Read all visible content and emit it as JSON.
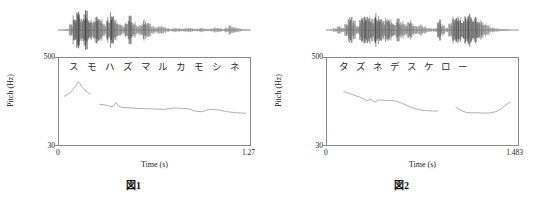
{
  "figures": [
    {
      "caption_label": "図",
      "caption_number": "1",
      "kana": [
        "ス",
        "モ",
        "ハ",
        "ズ",
        "マ",
        "ル",
        "カ",
        "モ",
        "シ",
        "ネ"
      ],
      "axes": {
        "ylabel": "Pitch (Hz)",
        "ytick_top": "500",
        "ytick_bottom": "30",
        "xlabel": "Time (s)",
        "xtick_left": "0",
        "xtick_right": "1.27"
      },
      "chart_data": {
        "type": "line",
        "title": "図 1",
        "xlabel": "Time (s)",
        "ylabel": "Pitch (Hz)",
        "xlim": [
          0,
          1.27
        ],
        "ylim": [
          30,
          500
        ],
        "yscale": "log",
        "grid": false,
        "legend": "none",
        "annotations": [
          "ス",
          "モ",
          "ハ",
          "ズ",
          "マ",
          "ル",
          "カ",
          "モ",
          "シ",
          "ネ"
        ],
        "series": [
          {
            "name": "f0-contour",
            "x": [
              0.035,
              0.055,
              0.075,
              0.09,
              0.105,
              0.118,
              0.13,
              0.14,
              0.15,
              0.165,
              0.18,
              0.195,
              0.21
            ],
            "y": [
              145,
              152,
              163,
              178,
              196,
              215,
              232,
              218,
              200,
              183,
              172,
              163,
              156
            ]
          },
          {
            "name": "f0-contour-2",
            "x": [
              0.27,
              0.3,
              0.33,
              0.36,
              0.38,
              0.4,
              0.43,
              0.47,
              0.52,
              0.58,
              0.64,
              0.7,
              0.76,
              0.82,
              0.86,
              0.9,
              0.95,
              1.0,
              1.06,
              1.12,
              1.18,
              1.24
            ],
            "y": [
              112,
              110,
              106,
              104,
              118,
              104,
              101,
              100,
              98,
              97,
              96,
              95,
              99,
              98,
              97,
              90,
              88,
              95,
              93,
              88,
              85,
              84
            ]
          }
        ],
        "waveform": {
          "name": "speech-waveform",
          "envelope": [
            0.02,
            0.03,
            0.05,
            0.35,
            0.72,
            0.88,
            0.62,
            0.95,
            0.7,
            0.45,
            0.8,
            0.55,
            0.3,
            0.62,
            0.88,
            0.52,
            0.35,
            0.25,
            0.48,
            0.72,
            0.4,
            0.22,
            0.3,
            0.52,
            0.34,
            0.2,
            0.14,
            0.22,
            0.16,
            0.1,
            0.08,
            0.12,
            0.09,
            0.07,
            0.1,
            0.13,
            0.09,
            0.07,
            0.11,
            0.08,
            0.06,
            0.09,
            0.14,
            0.1,
            0.07,
            0.12,
            0.22,
            0.16,
            0.1,
            0.06,
            0.04,
            0.03
          ]
        }
      }
    },
    {
      "caption_label": "図",
      "caption_number": "2",
      "kana": [
        "タ",
        "ズ",
        "ネ",
        "デ",
        "ス",
        "ケ",
        "ロ",
        "ー"
      ],
      "axes": {
        "ylabel": "Pitch (Hz)",
        "ytick_top": "500",
        "ytick_bottom": "30",
        "xlabel": "Time (s)",
        "xtick_left": "0",
        "xtick_right": "1.483"
      },
      "chart_data": {
        "type": "line",
        "title": "図 2",
        "xlabel": "Time (s)",
        "ylabel": "Pitch (Hz)",
        "xlim": [
          0,
          1.483
        ],
        "ylim": [
          30,
          500
        ],
        "yscale": "log",
        "grid": false,
        "legend": "none",
        "annotations": [
          "タ",
          "ズ",
          "ネ",
          "デ",
          "ス",
          "ケ",
          "ロ",
          "ー"
        ],
        "series": [
          {
            "name": "f0-contour-1",
            "x": [
              0.13,
              0.17,
              0.21,
              0.25,
              0.28,
              0.31,
              0.34,
              0.37,
              0.4,
              0.43,
              0.46,
              0.5,
              0.54,
              0.58,
              0.62,
              0.66,
              0.7,
              0.74,
              0.78,
              0.82,
              0.86
            ],
            "y": [
              168,
              160,
              150,
              142,
              134,
              126,
              132,
              120,
              128,
              128,
              127,
              126,
              124,
              116,
              108,
              100,
              95,
              92,
              91,
              90,
              90
            ]
          },
          {
            "name": "f0-contour-2",
            "x": [
              1.0,
              1.04,
              1.08,
              1.12,
              1.17,
              1.22,
              1.27,
              1.31,
              1.35,
              1.39,
              1.42
            ],
            "y": [
              103,
              92,
              86,
              85,
              85,
              84,
              85,
              88,
              96,
              110,
              120
            ]
          }
        ],
        "waveform": {
          "name": "speech-waveform",
          "envelope": [
            0.02,
            0.04,
            0.1,
            0.22,
            0.14,
            0.3,
            0.72,
            0.45,
            0.3,
            0.62,
            0.8,
            0.68,
            0.55,
            0.82,
            0.7,
            0.48,
            0.62,
            0.55,
            0.4,
            0.58,
            0.44,
            0.3,
            0.46,
            0.32,
            0.2,
            0.28,
            0.18,
            0.12,
            0.08,
            0.1,
            0.62,
            0.3,
            0.12,
            0.35,
            0.68,
            0.78,
            0.62,
            0.72,
            0.8,
            0.64,
            0.7,
            0.52,
            0.38,
            0.26,
            0.16,
            0.1,
            0.07,
            0.05,
            0.04,
            0.03,
            0.02,
            0.02
          ]
        }
      }
    }
  ]
}
